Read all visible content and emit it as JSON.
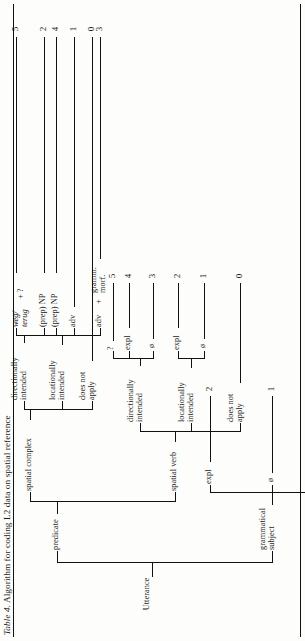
{
  "caption": {
    "label": "Table 4.",
    "text": "Algorithm for coding L2 data on spatial reference"
  },
  "tree": {
    "root": "Utterance",
    "branches": {
      "grammatical_subject": "grammatical\nsubject",
      "predicate": "predicate",
      "spatial_verb": "spatial verb",
      "spatial_complex": "spatial complex",
      "does_not_apply": "does not\napply",
      "locationally_intended": "locationally\nintended",
      "directionally_intended": "directionally\nintended"
    }
  },
  "labels": {
    "utterance": "Utterance",
    "grammatical_subject_l1": "grammatical",
    "grammatical_subject_l2": "subject",
    "predicate": "predicate",
    "spatial_verb": "spatial verb",
    "spatial_complex": "spatial complex",
    "does_not_apply_l1": "does not",
    "does_not_apply_l2": "apply",
    "locationally_l1": "locationally",
    "locationally_l2": "intended",
    "directionally_l1": "directionally",
    "directionally_l2": "intended",
    "zero": "ø",
    "expl": "expl",
    "question": "?",
    "adv": "adv",
    "prep_np": "(prep) NP",
    "weg": "weg/",
    "terug": "terug",
    "plus": "+",
    "plus_q": "+ ?",
    "gramm_l1": "gramm.",
    "gramm_l2": "morf.",
    "plus_gramm": "+"
  },
  "scores": {
    "gs_does_not_apply": "0",
    "gs_zero": "1",
    "gs_expl": "2",
    "sv_does_not_apply": "0",
    "sv_loc_zero": "1",
    "sv_loc_expl": "2",
    "sv_dir_zero": "3",
    "sv_dir_expl": "4",
    "sv_dir_question": "5",
    "sc_does_not_apply": "0",
    "sc_loc_adv": "1",
    "sc_loc_prep_np": "2",
    "sc_dir_adv_gramm": "3",
    "sc_dir_prep_np": "4",
    "sc_dir_weg_terug": "5"
  },
  "colors": {
    "ink": "#111111",
    "paper": "#fdfdfb"
  }
}
